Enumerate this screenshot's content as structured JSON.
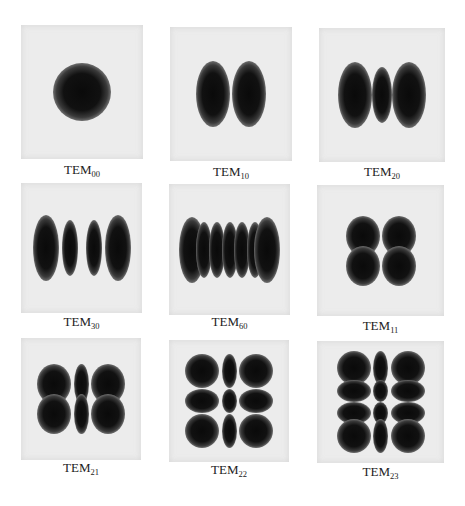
{
  "figure": {
    "panels": [
      {
        "mode": "TEM",
        "indices": "00",
        "m": 0,
        "n": 0
      },
      {
        "mode": "TEM",
        "indices": "10",
        "m": 1,
        "n": 0
      },
      {
        "mode": "TEM",
        "indices": "20",
        "m": 2,
        "n": 0
      },
      {
        "mode": "TEM",
        "indices": "30",
        "m": 3,
        "n": 0
      },
      {
        "mode": "TEM",
        "indices": "60",
        "m": 6,
        "n": 0
      },
      {
        "mode": "TEM",
        "indices": "11",
        "m": 1,
        "n": 1
      },
      {
        "mode": "TEM",
        "indices": "21",
        "m": 2,
        "n": 1
      },
      {
        "mode": "TEM",
        "indices": "22",
        "m": 2,
        "n": 2
      },
      {
        "mode": "TEM",
        "indices": "23",
        "m": 2,
        "n": 3
      }
    ],
    "colors": {
      "background": "#ffffff",
      "panel": "#ececec",
      "spot": "#0a0a0a",
      "text": "#222222"
    }
  }
}
